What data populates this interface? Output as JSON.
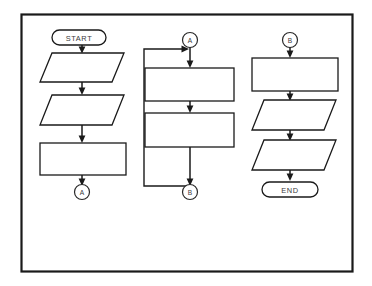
{
  "diagram": {
    "type": "flowchart",
    "title": "",
    "background_color": "#ffffff",
    "stroke_color": "#1a1a1a",
    "frame": {
      "name": "outer-border",
      "x": 21,
      "y": 14,
      "width": 332,
      "height": 258
    },
    "columns": [
      {
        "name": "left-column",
        "nodes": [
          {
            "id": "start",
            "shape": "terminator",
            "label": "START"
          },
          {
            "id": "l-io-1",
            "shape": "parallelogram",
            "label": ""
          },
          {
            "id": "l-io-2",
            "shape": "parallelogram",
            "label": ""
          },
          {
            "id": "l-proc-1",
            "shape": "rectangle",
            "label": ""
          },
          {
            "id": "l-conn-out",
            "shape": "connector",
            "label": "A"
          }
        ]
      },
      {
        "name": "middle-column",
        "nodes": [
          {
            "id": "m-conn-in",
            "shape": "connector",
            "label": "A"
          },
          {
            "id": "m-proc-1",
            "shape": "rectangle",
            "label": ""
          },
          {
            "id": "m-proc-2",
            "shape": "rectangle",
            "label": ""
          },
          {
            "id": "m-conn-out",
            "shape": "connector",
            "label": "B"
          }
        ],
        "has_feedback_loop": true
      },
      {
        "name": "right-column",
        "nodes": [
          {
            "id": "r-conn-in",
            "shape": "connector",
            "label": "B"
          },
          {
            "id": "r-proc-1",
            "shape": "rectangle",
            "label": ""
          },
          {
            "id": "r-io-1",
            "shape": "parallelogram",
            "label": ""
          },
          {
            "id": "r-io-2",
            "shape": "parallelogram",
            "label": ""
          },
          {
            "id": "end",
            "shape": "terminator",
            "label": "END"
          }
        ]
      }
    ],
    "labels": {
      "start": "START",
      "end": "END",
      "connector_a_out": "A",
      "connector_a_in": "A",
      "connector_b_out": "B",
      "connector_b_in": "B"
    }
  }
}
